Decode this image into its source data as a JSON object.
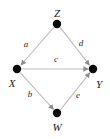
{
  "figure": {
    "type": "directed-graph",
    "background_color": "#ffffff",
    "edge_color": "#b9b9b9",
    "node_color": "#0a0a0a",
    "label_color": "#1a1a1a",
    "width": 110,
    "height": 139
  },
  "nodes": [
    {
      "id": "Z",
      "label": "Z",
      "cx": 57,
      "cy": 24,
      "r": 4.2,
      "label_x": 57,
      "label_y": 13
    },
    {
      "id": "X",
      "label": "X",
      "cx": 17,
      "cy": 69,
      "r": 4.2,
      "label_x": 12,
      "label_y": 83
    },
    {
      "id": "Y",
      "label": "Y",
      "cx": 93,
      "cy": 69,
      "r": 4.2,
      "label_x": 99,
      "label_y": 84
    },
    {
      "id": "W",
      "label": "W",
      "cx": 57,
      "cy": 113,
      "r": 4.2,
      "label_x": 57,
      "label_y": 127
    }
  ],
  "edges": [
    {
      "id": "a",
      "label": "a",
      "from": "Z",
      "to": "X",
      "label_x": 26,
      "label_y": 44
    },
    {
      "id": "d",
      "label": "d",
      "from": "Z",
      "to": "Y",
      "label_x": 81,
      "label_y": 43
    },
    {
      "id": "c",
      "label": "c",
      "from": "X",
      "to": "Y",
      "label_x": 56,
      "label_y": 59
    },
    {
      "id": "b",
      "label": "b",
      "from": "X",
      "to": "W",
      "label_x": 30,
      "label_y": 94
    },
    {
      "id": "e",
      "label": "e",
      "from": "W",
      "to": "Y",
      "label_x": 78,
      "label_y": 95
    }
  ]
}
